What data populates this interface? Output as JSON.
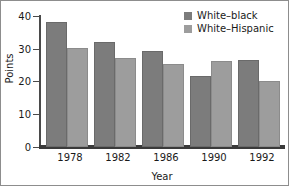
{
  "chart_data": {
    "type": "bar",
    "title": "",
    "xlabel": "Year",
    "ylabel": "Points",
    "categories": [
      "1978",
      "1982",
      "1986",
      "1990",
      "1992"
    ],
    "series": [
      {
        "name": "White–black",
        "color": "#7c7c7c",
        "values": [
          38.3,
          32.2,
          29.3,
          21.7,
          26.6
        ]
      },
      {
        "name": "White–Hispanic",
        "color": "#9d9d9d",
        "values": [
          30.1,
          27.2,
          25.5,
          26.3,
          20.1
        ]
      }
    ],
    "ylim": [
      0,
      40
    ],
    "yticks": [
      "0",
      "10",
      "20",
      "30",
      "40"
    ],
    "grid": false,
    "legend_position": "top-right"
  }
}
